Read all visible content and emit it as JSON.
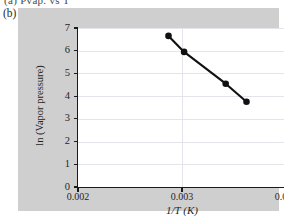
{
  "figure": {
    "previous_caption_fragment": "(a)  Pvap. vs T",
    "panel_label": "(b)"
  },
  "colors": {
    "panel_background": "#cfcfcf",
    "plot_background": "#ffffff",
    "axis": "#1a1a1a",
    "gridline": "#e4e4ea",
    "series": "#111111",
    "page_background": "#ffffff"
  },
  "chart_data": {
    "type": "line",
    "title": "",
    "xlabel": "1/T (K)",
    "ylabel": "ln (Vapor pressure)",
    "xlim": [
      0.002,
      0.004
    ],
    "ylim": [
      0,
      7
    ],
    "xticks": [
      0.002,
      0.003,
      0.004
    ],
    "xtick_labels": [
      "0.002",
      "0.003",
      "0.004"
    ],
    "yticks": [
      0,
      1,
      2,
      3,
      4,
      5,
      6,
      7
    ],
    "ytick_labels": [
      "0",
      "1",
      "2",
      "3",
      "4",
      "5",
      "6",
      "7"
    ],
    "grid": true,
    "grid_axes": "both",
    "legend": false,
    "legend_position": "none",
    "marker": "filled-circle",
    "line_style": "solid",
    "series": [
      {
        "name": "ln(Vapor pressure) vs 1/T",
        "x": [
          0.00287,
          0.00302,
          0.00342,
          0.00362
        ],
        "y": [
          6.65,
          5.95,
          4.55,
          3.75
        ]
      }
    ]
  }
}
